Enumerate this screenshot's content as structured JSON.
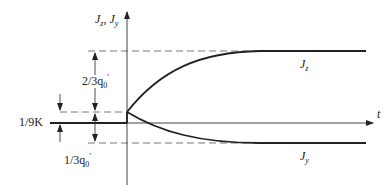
{
  "diagram": {
    "y_axis_label_main": "J",
    "y_axis_label_sub_z": "z",
    "y_axis_label_sep": ", ",
    "y_axis_label_sub_y": "y",
    "x_axis_label": "t",
    "curve_upper_label": "J",
    "curve_upper_sub": "z",
    "curve_lower_label": "J",
    "curve_lower_sub": "y",
    "dim_upper_label_pre": "2/3q",
    "dim_upper_label_sub": "0",
    "dim_upper_label_prime": "′",
    "dim_lower_label_pre": "1/3q",
    "dim_lower_label_sub": "0",
    "dim_lower_label_prime": "′",
    "dim_small_label": "1/9K",
    "colors": {
      "line": "#222222",
      "dash": "#555555",
      "axis": "#444444"
    }
  }
}
